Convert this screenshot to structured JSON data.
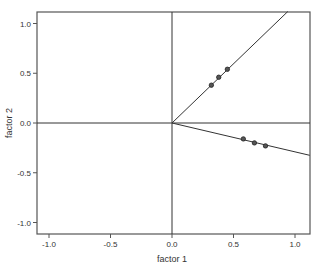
{
  "chart_data": {
    "type": "scatter",
    "title": "",
    "xlabel": "factor 1",
    "ylabel": "factor 2",
    "xlim": [
      -1.12,
      1.12
    ],
    "ylim": [
      -1.12,
      1.12
    ],
    "grid": false,
    "legend": null,
    "x_ticks": [
      -1.0,
      -0.5,
      0.0,
      0.5,
      1.0
    ],
    "x_tick_labels": [
      "-1.0",
      "-0.5",
      "0.0",
      "0.5",
      "1.0"
    ],
    "y_ticks": [
      -1.0,
      -0.5,
      0.0,
      0.5,
      1.0
    ],
    "y_tick_labels": [
      "-1.0",
      "-0.5",
      "0.0",
      "0.5",
      "1.0"
    ],
    "reference_lines": [
      {
        "type": "horizontal",
        "y": 0.0
      },
      {
        "type": "vertical",
        "x": 0.0
      }
    ],
    "series": [
      {
        "name": "group 1",
        "points": [
          [
            0.32,
            0.38
          ],
          [
            0.38,
            0.46
          ],
          [
            0.45,
            0.54
          ]
        ],
        "fit_line": {
          "from": [
            0.0,
            0.0
          ],
          "slope": 1.19
        }
      },
      {
        "name": "group 2",
        "points": [
          [
            0.58,
            -0.16
          ],
          [
            0.67,
            -0.2
          ],
          [
            0.76,
            -0.23
          ]
        ],
        "fit_line": {
          "from": [
            0.0,
            0.0
          ],
          "slope": -0.29
        }
      }
    ]
  },
  "colors": {
    "axis": "#555555",
    "line": "#333333",
    "marker_fill": "#555555",
    "marker_stroke": "#222222",
    "text": "#333333"
  }
}
